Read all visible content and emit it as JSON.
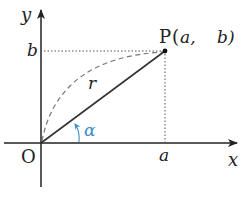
{
  "diagram": {
    "title": "",
    "origin_label": "O",
    "x_axis_label": "x",
    "y_axis_label": "y",
    "x_tick_label": "a",
    "y_tick_label": "b",
    "point": {
      "name": "P",
      "coords_text": "(a,  b)",
      "coord_a": "a,",
      "coord_b": "b)",
      "open_paren": "("
    },
    "radius_label": "r",
    "angle_label": "α",
    "colors": {
      "axis": "#222222",
      "segment": "#333333",
      "dashed_arc": "#777777",
      "dotted_guides": "#555555",
      "angle": "#3a8cc8"
    }
  }
}
